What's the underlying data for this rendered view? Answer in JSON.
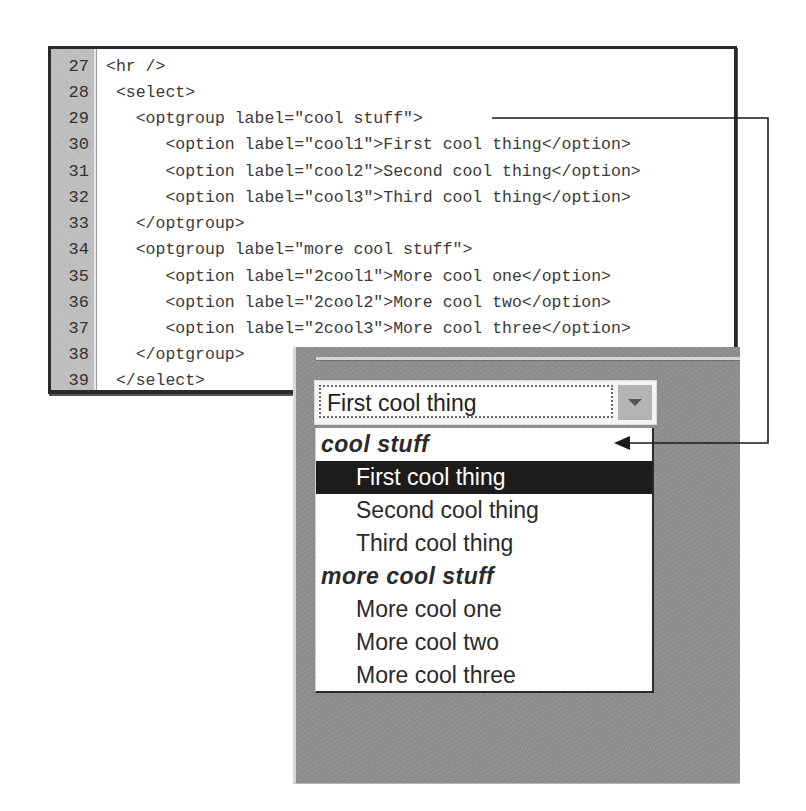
{
  "code_listing": {
    "lines": [
      {
        "number": "27",
        "code": "<hr />"
      },
      {
        "number": "28",
        "code": " <select>"
      },
      {
        "number": "29",
        "code": "   <optgroup label=\"cool stuff\">"
      },
      {
        "number": "30",
        "code": "      <option label=\"cool1\">First cool thing</option>"
      },
      {
        "number": "31",
        "code": "      <option label=\"cool2\">Second cool thing</option>"
      },
      {
        "number": "32",
        "code": "      <option label=\"cool3\">Third cool thing</option>"
      },
      {
        "number": "33",
        "code": "   </optgroup>"
      },
      {
        "number": "34",
        "code": "   <optgroup label=\"more cool stuff\">"
      },
      {
        "number": "35",
        "code": "      <option label=\"2cool1\">More cool one</option>"
      },
      {
        "number": "36",
        "code": "      <option label=\"2cool2\">More cool two</option>"
      },
      {
        "number": "37",
        "code": "      <option label=\"2cool3\">More cool three</option>"
      },
      {
        "number": "38",
        "code": "   </optgroup>"
      },
      {
        "number": "39",
        "code": " </select>"
      }
    ]
  },
  "rendered_select": {
    "selected_value": "First cool thing",
    "groups": [
      {
        "label": "cool stuff",
        "options": [
          "First cool thing",
          "Second cool thing",
          "Third cool thing"
        ]
      },
      {
        "label": "more cool stuff",
        "options": [
          "More cool one",
          "More cool two",
          "More cool three"
        ]
      }
    ],
    "highlighted_option": "First cool thing"
  },
  "annotation": {
    "connector": "optgroup label on line 29 maps to group header 'cool stuff' in rendered dropdown"
  },
  "colors": {
    "panel_bg": "#8e8e8e",
    "gutter_bg": "#bcbcbc",
    "highlight_bg": "#1c1c1c",
    "highlight_fg": "#ffffff",
    "border_dark": "#2a2a2a"
  }
}
